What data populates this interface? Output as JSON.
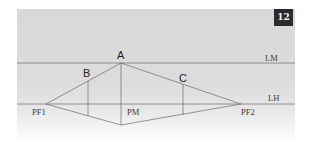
{
  "figure": {
    "badge_number": "12",
    "lines": {
      "horizon_line": {
        "label": "LH",
        "y": 104
      },
      "measuring_line": {
        "label": "LM",
        "y": 63
      }
    },
    "points": {
      "A": {
        "label": "A",
        "x": 121,
        "y": 63
      },
      "B": {
        "label": "B",
        "x": 88,
        "y": 74
      },
      "C": {
        "label": "C",
        "x": 183,
        "y": 85
      },
      "PF1": {
        "label": "PF1",
        "x": 46,
        "y": 104
      },
      "PF2": {
        "label": "PF2",
        "x": 241,
        "y": 104
      },
      "PM": {
        "label": "PM",
        "x": 121,
        "y": 104
      }
    },
    "colors": {
      "panel": "#d8d8d8",
      "line": "#6a6a6a",
      "badge_bg": "#2b2b2b",
      "badge_text": "#f2f2f2"
    }
  }
}
